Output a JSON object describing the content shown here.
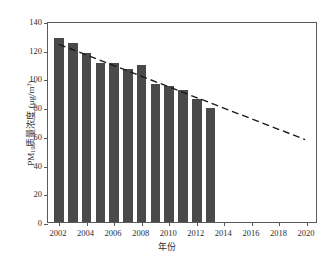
{
  "chart_data": {
    "type": "bar",
    "title": "",
    "xlabel": "年份",
    "ylabel": "PM10质量浓度（μg/m³）",
    "ylabel_parts": {
      "prefix": "PM",
      "subscript": "10",
      "middle": "质量浓度 (",
      "unit_base": "μg/m",
      "unit_exp": "3",
      "suffix": ")"
    },
    "xlim": [
      2001.2,
      2020.8
    ],
    "ylim": [
      0,
      140
    ],
    "ytick_labels": [
      "0",
      "20",
      "40",
      "60",
      "80",
      "100",
      "120",
      "140"
    ],
    "yticks": [
      0,
      20,
      40,
      60,
      80,
      100,
      120,
      140
    ],
    "xtick_labels": [
      "2002",
      "2004",
      "2006",
      "2008",
      "2010",
      "2012",
      "2014",
      "2016",
      "2018",
      "2020"
    ],
    "xticks": [
      2002,
      2004,
      2006,
      2008,
      2010,
      2012,
      2014,
      2016,
      2018,
      2020
    ],
    "grid": false,
    "legend": null,
    "bar_color": "#4a4a4a",
    "trend_color": "#1a1a1a",
    "categories": [
      2002,
      2003,
      2004,
      2005,
      2006,
      2007,
      2008,
      2009,
      2010,
      2011,
      2012,
      2013
    ],
    "values": [
      128,
      125,
      117.5,
      111,
      110.5,
      106.5,
      109.5,
      96,
      95,
      92,
      86,
      79.5
    ],
    "series": [
      {
        "name": "PM10质量浓度",
        "type": "bar",
        "categories": [
          2002,
          2003,
          2004,
          2005,
          2006,
          2007,
          2008,
          2009,
          2010,
          2011,
          2012,
          2013
        ],
        "values": [
          128,
          125,
          117.5,
          111,
          110.5,
          106.5,
          109.5,
          96,
          95,
          92,
          86,
          79.5
        ]
      },
      {
        "name": "趋势线",
        "type": "line",
        "style": "dashed",
        "x": [
          2002,
          2020
        ],
        "values": [
          125,
          58
        ]
      }
    ],
    "annotations": []
  }
}
